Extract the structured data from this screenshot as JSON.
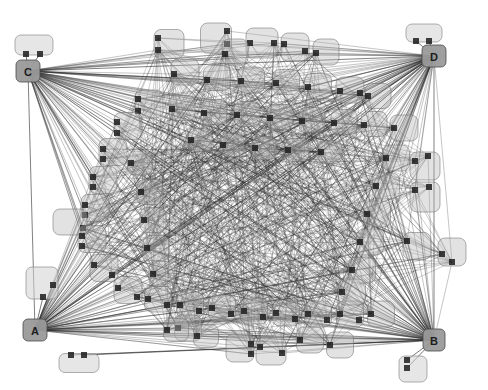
{
  "diagram": {
    "title": "",
    "type": "force-directed-network-graph",
    "width": 488,
    "height": 390,
    "background_color": "#ffffff",
    "node_fill_color": "#b4b4b4",
    "node_stroke_color": "#6e6e6e",
    "node_opacity": 0.38,
    "hub_fill_color": "#9a9a9a",
    "hub_stroke_color": "#4a4a4a",
    "port_color": "#232323",
    "edge_color": "#2b2b2b",
    "edge_opacity": 0.55,
    "edge_width": 0.5
  },
  "hubs": [
    {
      "id": "C",
      "label": "C",
      "x": 28,
      "y": 71,
      "w": 24,
      "h": 22
    },
    {
      "id": "D",
      "label": "D",
      "x": 434,
      "y": 56,
      "w": 24,
      "h": 22
    },
    {
      "id": "A",
      "label": "A",
      "x": 35,
      "y": 330,
      "w": 24,
      "h": 22
    },
    {
      "id": "B",
      "label": "B",
      "x": 434,
      "y": 340,
      "w": 22,
      "h": 22
    }
  ],
  "satellites": [
    {
      "id": "s-c-top",
      "x": 34,
      "y": 45,
      "w": 38,
      "h": 20,
      "ports": [
        [
          -8,
          9
        ],
        [
          6,
          9
        ]
      ]
    },
    {
      "id": "s-d-top",
      "x": 424,
      "y": 33,
      "w": 36,
      "h": 18,
      "ports": [
        [
          -8,
          8
        ],
        [
          5,
          8
        ]
      ]
    },
    {
      "id": "s-a-top",
      "x": 42,
      "y": 283,
      "w": 32,
      "h": 32,
      "ports": [
        [
          11,
          2
        ],
        [
          1,
          14
        ]
      ]
    },
    {
      "id": "s-a-bot",
      "x": 79,
      "y": 363,
      "w": 40,
      "h": 19,
      "ports": [
        [
          -8,
          -8
        ],
        [
          5,
          -8
        ]
      ]
    },
    {
      "id": "s-b-bot",
      "x": 413,
      "y": 369,
      "w": 28,
      "h": 26,
      "ports": [
        [
          -6,
          -9
        ],
        [
          -6,
          -1
        ]
      ]
    }
  ],
  "nodes": [
    {
      "id": "n1",
      "x": 169,
      "y": 44,
      "w": 30,
      "h": 29,
      "ports": [
        [
          -11,
          -6
        ],
        [
          -11,
          6
        ]
      ]
    },
    {
      "id": "n2",
      "x": 216,
      "y": 38,
      "w": 31,
      "h": 30,
      "ports": [
        [
          11,
          -7
        ],
        [
          11,
          6
        ]
      ]
    },
    {
      "id": "n3",
      "x": 262,
      "y": 43,
      "w": 32,
      "h": 30,
      "ports": [
        [
          -12,
          0
        ],
        [
          12,
          0
        ]
      ]
    },
    {
      "id": "n4",
      "x": 295,
      "y": 47,
      "w": 28,
      "h": 28,
      "ports": [
        [
          -11,
          -3
        ],
        [
          10,
          4
        ]
      ]
    },
    {
      "id": "n5",
      "x": 326,
      "y": 52,
      "w": 26,
      "h": 26,
      "ports": [
        [
          -10,
          1
        ]
      ]
    },
    {
      "id": "n6",
      "x": 235,
      "y": 52,
      "w": 26,
      "h": 26,
      "ports": [
        [
          -10,
          2
        ]
      ]
    },
    {
      "id": "n7",
      "x": 185,
      "y": 72,
      "w": 28,
      "h": 26,
      "ports": [
        [
          -11,
          2
        ]
      ]
    },
    {
      "id": "n8",
      "x": 217,
      "y": 78,
      "w": 27,
      "h": 25,
      "ports": [
        [
          -10,
          2
        ]
      ]
    },
    {
      "id": "n9",
      "x": 251,
      "y": 80,
      "w": 27,
      "h": 26,
      "ports": [
        [
          -10,
          1
        ]
      ]
    },
    {
      "id": "n10",
      "x": 286,
      "y": 82,
      "w": 27,
      "h": 25,
      "ports": [
        [
          -10,
          1
        ]
      ]
    },
    {
      "id": "n11",
      "x": 318,
      "y": 86,
      "w": 27,
      "h": 25,
      "ports": [
        [
          -10,
          1
        ]
      ]
    },
    {
      "id": "n12",
      "x": 350,
      "y": 90,
      "w": 28,
      "h": 26,
      "ports": [
        [
          -10,
          1
        ],
        [
          10,
          3
        ]
      ]
    },
    {
      "id": "n13",
      "x": 378,
      "y": 96,
      "w": 26,
      "h": 25,
      "ports": [
        [
          -10,
          0
        ]
      ]
    },
    {
      "id": "n14",
      "x": 149,
      "y": 104,
      "w": 28,
      "h": 28,
      "ports": [
        [
          -11,
          -5
        ],
        [
          -11,
          7
        ]
      ]
    },
    {
      "id": "n15",
      "x": 182,
      "y": 108,
      "w": 26,
      "h": 25,
      "ports": [
        [
          -10,
          1
        ]
      ]
    },
    {
      "id": "n16",
      "x": 214,
      "y": 112,
      "w": 26,
      "h": 25,
      "ports": [
        [
          -10,
          1
        ]
      ]
    },
    {
      "id": "n17",
      "x": 247,
      "y": 114,
      "w": 26,
      "h": 25,
      "ports": [
        [
          -10,
          1
        ]
      ]
    },
    {
      "id": "n18",
      "x": 280,
      "y": 117,
      "w": 26,
      "h": 25,
      "ports": [
        [
          -10,
          1
        ]
      ]
    },
    {
      "id": "n19",
      "x": 312,
      "y": 120,
      "w": 26,
      "h": 25,
      "ports": [
        [
          -10,
          1
        ]
      ]
    },
    {
      "id": "n20",
      "x": 344,
      "y": 122,
      "w": 26,
      "h": 25,
      "ports": [
        [
          -10,
          1
        ]
      ]
    },
    {
      "id": "n21",
      "x": 374,
      "y": 124,
      "w": 26,
      "h": 25,
      "ports": [
        [
          -10,
          1
        ]
      ]
    },
    {
      "id": "n22",
      "x": 128,
      "y": 126,
      "w": 28,
      "h": 27,
      "ports": [
        [
          -11,
          -4
        ],
        [
          -11,
          7
        ]
      ]
    },
    {
      "id": "n23",
      "x": 113,
      "y": 152,
      "w": 28,
      "h": 27,
      "ports": [
        [
          -10,
          -3
        ],
        [
          -10,
          7
        ]
      ]
    },
    {
      "id": "n24",
      "x": 103,
      "y": 180,
      "w": 28,
      "h": 27,
      "ports": [
        [
          -10,
          -3
        ],
        [
          -10,
          7
        ]
      ]
    },
    {
      "id": "n25",
      "x": 95,
      "y": 208,
      "w": 28,
      "h": 27,
      "ports": [
        [
          -10,
          -3
        ],
        [
          -10,
          7
        ]
      ]
    },
    {
      "id": "n26",
      "x": 70,
      "y": 222,
      "w": 34,
      "h": 26,
      "ports": [
        [
          13,
          6
        ]
      ]
    },
    {
      "id": "n27",
      "x": 92,
      "y": 239,
      "w": 28,
      "h": 27,
      "ports": [
        [
          -10,
          -3
        ],
        [
          -10,
          7
        ]
      ]
    },
    {
      "id": "n28",
      "x": 104,
      "y": 268,
      "w": 28,
      "h": 27,
      "ports": [
        [
          -10,
          -3
        ],
        [
          8,
          7
        ]
      ]
    },
    {
      "id": "n29",
      "x": 128,
      "y": 290,
      "w": 28,
      "h": 27,
      "ports": [
        [
          -10,
          -2
        ],
        [
          9,
          7
        ]
      ]
    },
    {
      "id": "n30",
      "x": 158,
      "y": 299,
      "w": 27,
      "h": 26,
      "ports": [
        [
          -10,
          0
        ],
        [
          9,
          6
        ]
      ]
    },
    {
      "id": "n31",
      "x": 150,
      "y": 192,
      "w": 26,
      "h": 25,
      "ports": [
        [
          -9,
          0
        ]
      ]
    },
    {
      "id": "n32",
      "x": 153,
      "y": 220,
      "w": 26,
      "h": 25,
      "ports": [
        [
          -9,
          0
        ]
      ]
    },
    {
      "id": "n33",
      "x": 156,
      "y": 248,
      "w": 26,
      "h": 25,
      "ports": [
        [
          -9,
          0
        ]
      ]
    },
    {
      "id": "n34",
      "x": 162,
      "y": 274,
      "w": 26,
      "h": 25,
      "ports": [
        [
          -9,
          0
        ]
      ]
    },
    {
      "id": "n35",
      "x": 190,
      "y": 305,
      "w": 27,
      "h": 26,
      "ports": [
        [
          -10,
          0
        ],
        [
          9,
          6
        ]
      ]
    },
    {
      "id": "n36",
      "x": 222,
      "y": 308,
      "w": 27,
      "h": 26,
      "ports": [
        [
          -10,
          0
        ],
        [
          9,
          6
        ]
      ]
    },
    {
      "id": "n37",
      "x": 254,
      "y": 311,
      "w": 27,
      "h": 26,
      "ports": [
        [
          -10,
          0
        ],
        [
          9,
          6
        ]
      ]
    },
    {
      "id": "n38",
      "x": 286,
      "y": 313,
      "w": 27,
      "h": 26,
      "ports": [
        [
          -10,
          0
        ],
        [
          9,
          6
        ]
      ]
    },
    {
      "id": "n39",
      "x": 318,
      "y": 314,
      "w": 27,
      "h": 26,
      "ports": [
        [
          -10,
          0
        ],
        [
          9,
          6
        ]
      ]
    },
    {
      "id": "n40",
      "x": 350,
      "y": 314,
      "w": 27,
      "h": 26,
      "ports": [
        [
          -10,
          0
        ],
        [
          9,
          6
        ]
      ]
    },
    {
      "id": "n41",
      "x": 381,
      "y": 314,
      "w": 27,
      "h": 26,
      "ports": [
        [
          -10,
          0
        ]
      ]
    },
    {
      "id": "n42",
      "x": 188,
      "y": 328,
      "w": 27,
      "h": 26,
      "ports": [
        [
          -10,
          0
        ]
      ]
    },
    {
      "id": "n43",
      "x": 240,
      "y": 348,
      "w": 28,
      "h": 28,
      "ports": [
        [
          11,
          -4
        ],
        [
          11,
          6
        ]
      ]
    },
    {
      "id": "n44",
      "x": 271,
      "y": 351,
      "w": 30,
      "h": 28,
      "ports": [
        [
          -11,
          -4
        ],
        [
          11,
          2
        ]
      ]
    },
    {
      "id": "n45",
      "x": 310,
      "y": 340,
      "w": 27,
      "h": 26,
      "ports": [
        [
          -10,
          0
        ]
      ]
    },
    {
      "id": "n46",
      "x": 340,
      "y": 345,
      "w": 27,
      "h": 26,
      "ports": [
        [
          -10,
          0
        ]
      ]
    },
    {
      "id": "n47",
      "x": 425,
      "y": 166,
      "w": 30,
      "h": 28,
      "ports": [
        [
          -10,
          -5
        ],
        [
          3,
          -10
        ]
      ]
    },
    {
      "id": "n48",
      "x": 425,
      "y": 197,
      "w": 30,
      "h": 30,
      "ports": [
        [
          -10,
          -7
        ],
        [
          4,
          -10
        ]
      ]
    },
    {
      "id": "n49",
      "x": 417,
      "y": 246,
      "w": 28,
      "h": 27,
      "ports": [
        [
          -10,
          -5
        ]
      ]
    },
    {
      "id": "n50",
      "x": 452,
      "y": 252,
      "w": 28,
      "h": 28,
      "ports": [
        [
          -10,
          2
        ],
        [
          0,
          10
        ]
      ]
    },
    {
      "id": "n51",
      "x": 404,
      "y": 128,
      "w": 28,
      "h": 26,
      "ports": [
        [
          -10,
          0
        ]
      ]
    },
    {
      "id": "n52",
      "x": 396,
      "y": 158,
      "w": 27,
      "h": 26,
      "ports": [
        [
          -10,
          0
        ]
      ]
    },
    {
      "id": "n53",
      "x": 386,
      "y": 186,
      "w": 27,
      "h": 26,
      "ports": [
        [
          -10,
          0
        ]
      ]
    },
    {
      "id": "n54",
      "x": 377,
      "y": 214,
      "w": 27,
      "h": 26,
      "ports": [
        [
          -10,
          0
        ]
      ]
    },
    {
      "id": "n55",
      "x": 370,
      "y": 242,
      "w": 27,
      "h": 26,
      "ports": [
        [
          -10,
          0
        ]
      ]
    },
    {
      "id": "n56",
      "x": 362,
      "y": 270,
      "w": 27,
      "h": 26,
      "ports": [
        [
          -10,
          0
        ]
      ]
    },
    {
      "id": "n57",
      "x": 352,
      "y": 292,
      "w": 27,
      "h": 26,
      "ports": [
        [
          -10,
          0
        ]
      ]
    },
    {
      "id": "n58",
      "x": 200,
      "y": 140,
      "w": 24,
      "h": 23,
      "ports": [
        [
          -9,
          0
        ]
      ]
    },
    {
      "id": "n59",
      "x": 232,
      "y": 145,
      "w": 24,
      "h": 23,
      "ports": [
        [
          -9,
          0
        ]
      ]
    },
    {
      "id": "n60",
      "x": 264,
      "y": 148,
      "w": 24,
      "h": 23,
      "ports": [
        [
          -9,
          0
        ]
      ]
    },
    {
      "id": "n61",
      "x": 297,
      "y": 150,
      "w": 24,
      "h": 23,
      "ports": [
        [
          -9,
          0
        ]
      ]
    },
    {
      "id": "n62",
      "x": 330,
      "y": 152,
      "w": 24,
      "h": 23,
      "ports": [
        [
          -9,
          0
        ]
      ]
    },
    {
      "id": "n63",
      "x": 140,
      "y": 163,
      "w": 25,
      "h": 24,
      "ports": [
        [
          -9,
          0
        ]
      ]
    },
    {
      "id": "n64",
      "x": 176,
      "y": 330,
      "w": 25,
      "h": 23,
      "ports": [
        [
          -9,
          0
        ]
      ]
    },
    {
      "id": "n65",
      "x": 206,
      "y": 336,
      "w": 25,
      "h": 23,
      "ports": [
        [
          -9,
          0
        ]
      ]
    }
  ],
  "legend": {
    "visible": false
  }
}
